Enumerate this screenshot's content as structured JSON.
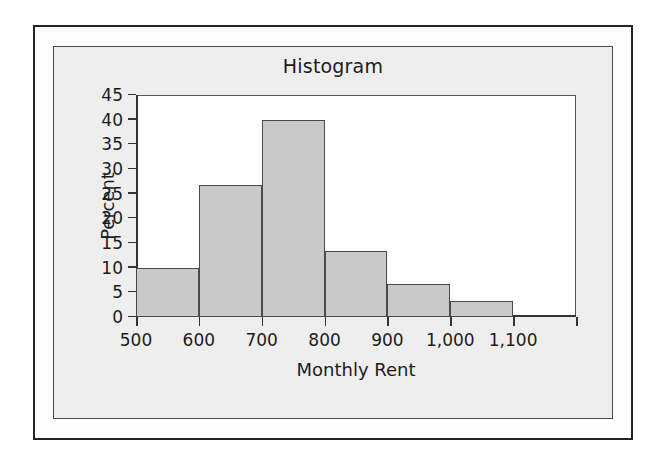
{
  "chart_data": {
    "type": "bar",
    "title": "Histogram",
    "xlabel": "Monthly Rent",
    "ylabel": "Percent",
    "grid": false,
    "legend": "none",
    "xlim": [
      500,
      1200
    ],
    "ylim": [
      0,
      45
    ],
    "bin_width": 100,
    "x_tick_labels": [
      "500",
      "600",
      "700",
      "800",
      "900",
      "1,000",
      "1,100",
      ""
    ],
    "x_tick_values": [
      500,
      600,
      700,
      800,
      900,
      1000,
      1100,
      1200
    ],
    "y_tick_labels": [
      "0",
      "5",
      "10",
      "15",
      "20",
      "25",
      "30",
      "35",
      "40",
      "45"
    ],
    "y_tick_values": [
      0,
      5,
      10,
      15,
      20,
      25,
      30,
      35,
      40,
      45
    ],
    "categories": [
      "500-600",
      "600-700",
      "700-800",
      "800-900",
      "900-1,000",
      "1,000-1,100"
    ],
    "bin_starts": [
      500,
      600,
      700,
      800,
      900,
      1000
    ],
    "bin_ends": [
      600,
      700,
      800,
      900,
      1000,
      1100
    ],
    "values": [
      10.0,
      26.7,
      40.0,
      13.3,
      6.7,
      3.3
    ],
    "bar_color": "#c9c9c9",
    "bar_edge_color": "#4a4a4a",
    "plot_background": "#ffffff",
    "panel_background": "#eeeeee"
  },
  "figure": {
    "title": "Histogram",
    "axis_title_x": "Monthly Rent",
    "axis_title_y": "Percent"
  }
}
